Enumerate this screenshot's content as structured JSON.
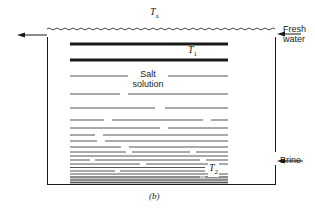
{
  "diagram": {
    "type": "salt-gradient solar pond cross-section",
    "figure_label": "(b)",
    "labels": {
      "ambient_temp": {
        "symbol": "T",
        "subscript": "a"
      },
      "upper_temp": {
        "symbol": "T",
        "subscript": "1"
      },
      "lower_temp": {
        "symbol": "T",
        "subscript": "2"
      },
      "salt_solution_line1": "Salt",
      "salt_solution_line2": "solution",
      "fresh_water_line1": "Fresh",
      "fresh_water_line2": "water",
      "brine": "Brine"
    },
    "arrows": [
      {
        "name": "outflow-arrow",
        "direction": "left",
        "position": "top-left"
      },
      {
        "name": "fresh-water-inflow-arrow",
        "direction": "left",
        "position": "top-right"
      },
      {
        "name": "brine-inflow-arrow",
        "direction": "left",
        "position": "bottom-right"
      }
    ],
    "colors": {
      "line": "#1a1a1a",
      "background": "#ffffff"
    }
  }
}
